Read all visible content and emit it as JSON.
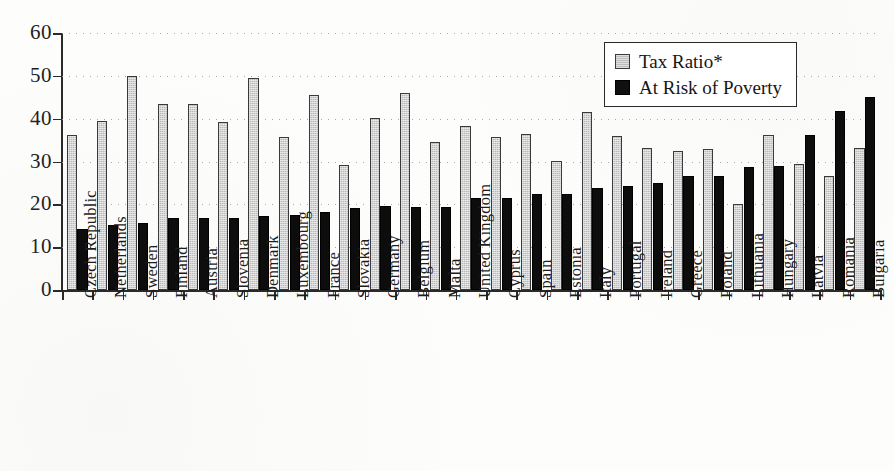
{
  "chart_data": {
    "type": "bar",
    "title": "",
    "xlabel": "",
    "ylabel": "",
    "ylim": [
      0,
      60
    ],
    "yticks": [
      0,
      10,
      20,
      30,
      40,
      50,
      60
    ],
    "grid": true,
    "legend_position": "top-right",
    "categories": [
      "Czech Republic",
      "Netherlands",
      "Sweden",
      "Finland",
      "Austria",
      "Slovenia",
      "Denmark",
      "Luxembourg",
      "France",
      "Slovakia",
      "Germany",
      "Belgium",
      "Malta",
      "United Kingdom",
      "Cyprus",
      "Spain",
      "Estonia",
      "Italy",
      "Portugal",
      "Ireland",
      "Greece",
      "Poland",
      "Lithuania",
      "Hungary",
      "Latvia",
      "Romania",
      "Bulgaria"
    ],
    "series": [
      {
        "name": "Tax Ratio*",
        "color": "#bdbdbd",
        "values": [
          36.2,
          39.4,
          50.0,
          43.5,
          43.5,
          39.2,
          49.6,
          35.8,
          45.6,
          29.3,
          40.2,
          46.1,
          34.6,
          38.3,
          35.7,
          36.4,
          30.2,
          41.5,
          36.0,
          33.1,
          32.5,
          33.0,
          20.0,
          36.1,
          29.4,
          26.7,
          33.2
        ]
      },
      {
        "name": "At Risk of Poverty",
        "color": "#101010",
        "values": [
          14.3,
          15.1,
          15.7,
          16.9,
          16.9,
          16.8,
          17.2,
          17.5,
          18.1,
          19.2,
          19.5,
          19.4,
          19.4,
          21.4,
          21.5,
          22.4,
          22.5,
          23.9,
          24.2,
          25.0,
          26.6,
          26.6,
          28.8,
          28.9,
          36.1,
          41.7,
          45.0
        ]
      }
    ]
  },
  "legend": {
    "items": [
      {
        "label": "Tax Ratio*",
        "swatch": "light"
      },
      {
        "label": "At Risk of Poverty",
        "swatch": "dark"
      }
    ]
  }
}
